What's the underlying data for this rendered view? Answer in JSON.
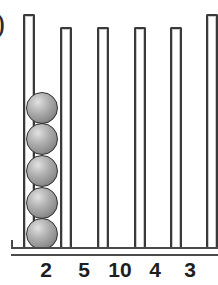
{
  "figure": {
    "item_marker": ")",
    "type": "abacus-column-diagram",
    "base_color": "#4a4a4a",
    "tube_color": "#3a3a3a",
    "sphere_color": "#9a9a9a",
    "label_color": "#1e1e1e"
  },
  "columns": [
    {
      "label": "2",
      "beads": 5,
      "tube_top": 14,
      "left": 23,
      "width": 12,
      "label_x": 46
    },
    {
      "label": "5",
      "beads": 0,
      "tube_top": 27,
      "left": 60,
      "width": 12,
      "label_x": 84
    },
    {
      "label": "10",
      "beads": 0,
      "tube_top": 27,
      "left": 97,
      "width": 12,
      "label_x": 120
    },
    {
      "label": "4",
      "beads": 0,
      "tube_top": 27,
      "left": 134,
      "width": 12,
      "label_x": 155
    },
    {
      "label": "3",
      "beads": 0,
      "tube_top": 27,
      "left": 170,
      "width": 12,
      "label_x": 190
    },
    {
      "label": "",
      "beads": 0,
      "tube_top": 14,
      "left": 206,
      "width": 12,
      "label_x": 0
    }
  ],
  "beads": [
    {
      "x": 26,
      "y": 92
    },
    {
      "x": 26,
      "y": 123
    },
    {
      "x": 26,
      "y": 155
    },
    {
      "x": 26,
      "y": 187
    },
    {
      "x": 26,
      "y": 218
    }
  ],
  "labels": {
    "values": [
      "2",
      "5",
      "10",
      "4",
      "3"
    ]
  }
}
